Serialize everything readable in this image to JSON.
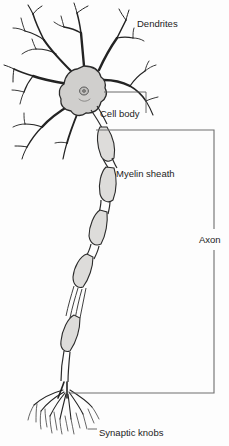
{
  "figure": {
    "background_color": "#fdfdfd",
    "line_color": "#232323",
    "fill_color": "#d0cfcd",
    "label_color": "#1c1c1c"
  },
  "labels": {
    "dendrites": "Dendrites",
    "cell_body": "Cell body",
    "myelin_sheath": "Myelin sheath",
    "axon": "Axon",
    "synaptic_knobs": "Synaptic knobs"
  },
  "parts": [
    {
      "name": "dendrites",
      "label": "Dendrites"
    },
    {
      "name": "cell-body",
      "label": "Cell body"
    },
    {
      "name": "myelin-sheath",
      "label": "Myelin sheath"
    },
    {
      "name": "axon",
      "label": "Axon"
    },
    {
      "name": "synaptic-knobs",
      "label": "Synaptic knobs"
    }
  ]
}
